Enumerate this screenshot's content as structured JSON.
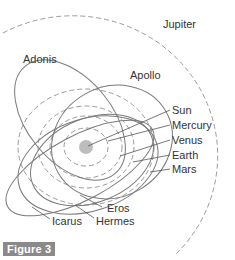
{
  "figure": {
    "caption": "Figure 3",
    "badge_color": "#8a8a8a"
  },
  "colors": {
    "orbit_line": "#7a7a7a",
    "planet_orbit_dashed": "#9a9a9a",
    "jupiter_orbit": "#9a9a9a",
    "sun_fill": "#bdbdbd",
    "label_text": "#333333",
    "leader_line": "#555555"
  },
  "labels": {
    "jupiter": "Jupiter",
    "adonis": "Adonis",
    "apollo": "Apollo",
    "sun": "Sun",
    "mercury": "Mercury",
    "venus": "Venus",
    "earth": "Earth",
    "mars": "Mars",
    "eros": "Eros",
    "icarus": "Icarus",
    "hermes": "Hermes"
  },
  "bodies": {
    "planets": [
      "Mercury",
      "Venus",
      "Earth",
      "Mars",
      "Jupiter"
    ],
    "asteroids": [
      "Adonis",
      "Apollo",
      "Eros",
      "Icarus",
      "Hermes"
    ],
    "star": "Sun"
  }
}
